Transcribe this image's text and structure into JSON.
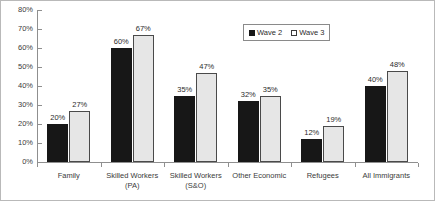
{
  "chart_data": {
    "type": "bar",
    "title": "",
    "subtitle": "",
    "xlabel": "",
    "ylabel": "",
    "ylim": [
      0,
      80
    ],
    "ytick_labels": [
      "0%",
      "10%",
      "20%",
      "30%",
      "40%",
      "50%",
      "60%",
      "70%",
      "80%"
    ],
    "ytick_values": [
      0,
      10,
      20,
      30,
      40,
      50,
      60,
      70,
      80
    ],
    "grid": false,
    "legend_position": "top-right",
    "categories": [
      "Family",
      "Skilled Workers (PA)",
      "Skilled Workers (S&O)",
      "Other Economic",
      "Refugees",
      "All Immigrants"
    ],
    "category_lines": [
      [
        "Family"
      ],
      [
        "Skilled Workers",
        "(PA)"
      ],
      [
        "Skilled Workers",
        "(S&O)"
      ],
      [
        "Other Economic"
      ],
      [
        "Refugees"
      ],
      [
        "All Immigrants"
      ]
    ],
    "series": [
      {
        "name": "Wave 2",
        "color": "#171717",
        "values": [
          20,
          60,
          35,
          32,
          12,
          40
        ],
        "labels": [
          "20%",
          "60%",
          "35%",
          "32%",
          "12%",
          "40%"
        ]
      },
      {
        "name": "Wave 3",
        "color": "#e6e6e6",
        "values": [
          27,
          67,
          47,
          35,
          19,
          48
        ],
        "labels": [
          "27%",
          "67%",
          "47%",
          "35%",
          "19%",
          "48%"
        ]
      }
    ]
  },
  "legend": {
    "items": [
      {
        "label": "Wave 2",
        "swatch": "filled-black-square"
      },
      {
        "label": "Wave 3",
        "swatch": "outlined-white-square"
      }
    ]
  }
}
